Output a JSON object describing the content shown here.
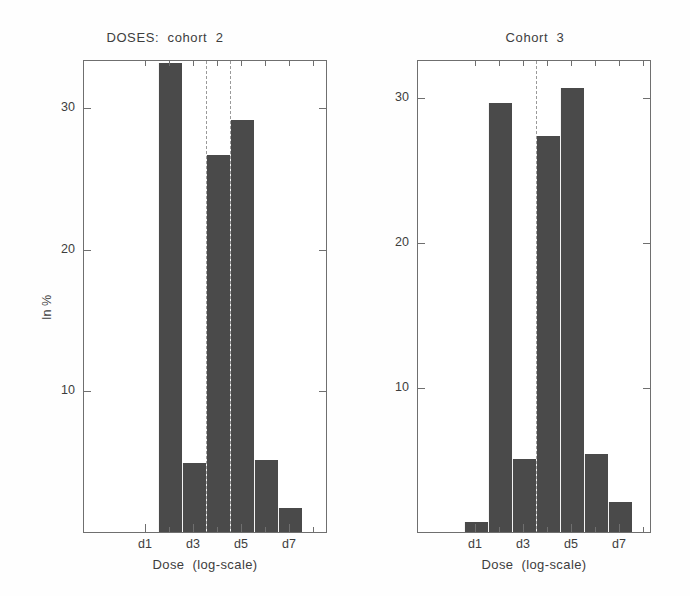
{
  "figure": {
    "background_color": "#fefefe",
    "bar_color": "#4a4a4a",
    "axis_color": "#6f6f6f",
    "dashline_color": "#9a9a9a"
  },
  "chart_data": [
    {
      "type": "bar",
      "title": "DOSES:  cohort  2",
      "xlabel": "Dose  (log-scale)",
      "ylabel": "In %",
      "categories": [
        "d1",
        "d2",
        "d3",
        "d4",
        "d5",
        "d6",
        "d7",
        "d8"
      ],
      "values": [
        0,
        33.1,
        4.9,
        26.6,
        29.1,
        5.1,
        1.7,
        0
      ],
      "ylim": [
        0,
        33.4
      ],
      "yticks": [
        10,
        20,
        30
      ],
      "ytick_labels": [
        "10",
        "20",
        "30"
      ],
      "xtick_labels": [
        "d1",
        "d3",
        "d5",
        "d7"
      ],
      "xtick_categories": [
        "d1",
        "d3",
        "d5",
        "d7"
      ],
      "grid": false,
      "legend": null,
      "annotations": [
        {
          "kind": "vertical-dashed-line",
          "at": "d3-d4 boundary"
        },
        {
          "kind": "vertical-dashed-line",
          "at": "d4-d5 boundary"
        }
      ]
    },
    {
      "type": "bar",
      "title": "Cohort  3",
      "xlabel": "Dose  (log-scale)",
      "ylabel": "",
      "categories": [
        "d1",
        "d2",
        "d3",
        "d4",
        "d5",
        "d6",
        "d7",
        "d8"
      ],
      "values": [
        0.7,
        29.6,
        5.0,
        27.3,
        30.6,
        5.4,
        2.1,
        0
      ],
      "ylim": [
        0,
        32.6
      ],
      "yticks": [
        10,
        20,
        30
      ],
      "ytick_labels": [
        "10",
        "20",
        "30"
      ],
      "xtick_labels": [
        "d1",
        "d3",
        "d5",
        "d7"
      ],
      "xtick_categories": [
        "d1",
        "d3",
        "d5",
        "d7"
      ],
      "grid": false,
      "legend": null,
      "annotations": [
        {
          "kind": "vertical-dashed-line",
          "at": "d3-d4 boundary"
        }
      ]
    }
  ]
}
